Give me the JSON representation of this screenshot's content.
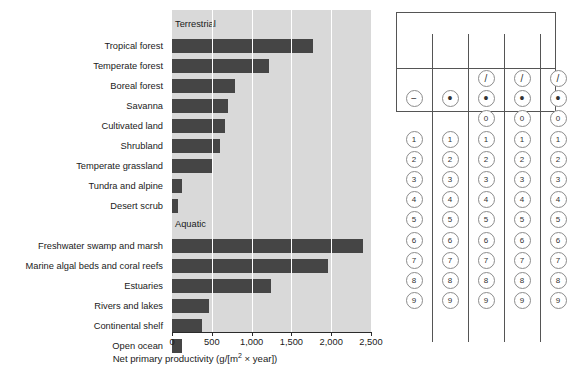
{
  "chart_data": {
    "type": "bar",
    "orientation": "horizontal",
    "title": "",
    "xlabel": "Net primary productivity (g/[m2 × year])",
    "xlabel_parts": {
      "pre": "Net primary productivity (g/[m",
      "sup": "2",
      "post": " × year])"
    },
    "ylabel": "",
    "xlim": [
      0,
      2500
    ],
    "xticks": [
      0,
      500,
      1000,
      1500,
      2000,
      2500
    ],
    "xtick_labels": [
      "0",
      "500",
      "1,000",
      "1,500",
      "2,000",
      "2,500"
    ],
    "grid": "vertical-white-gridlines",
    "legend": "none",
    "plot_bgcolor": "#d9d9d9",
    "bar_color": "#454545",
    "section_labels": [
      "Terrestrial",
      "Aquatic"
    ],
    "categories": [
      "Tropical forest",
      "Temperate forest",
      "Boreal forest",
      "Savanna",
      "Cultivated land",
      "Shrubland",
      "Temperate grassland",
      "Tundra and alpine",
      "Desert scrub",
      "Freshwater swamp and marsh",
      "Marine algal beds and coral reefs",
      "Estuaries",
      "Rivers and lakes",
      "Continental shelf",
      "Open ocean"
    ],
    "values": [
      1770,
      1220,
      790,
      700,
      670,
      600,
      520,
      130,
      70,
      2400,
      1960,
      1240,
      470,
      380,
      120
    ],
    "groups": [
      {
        "name": "Terrestrial",
        "categories": [
          "Tropical forest",
          "Temperate forest",
          "Boreal forest",
          "Savanna",
          "Cultivated land",
          "Shrubland",
          "Temperate grassland",
          "Tundra and alpine",
          "Desert scrub"
        ],
        "values": [
          1770,
          1220,
          790,
          700,
          670,
          600,
          520,
          130,
          70
        ]
      },
      {
        "name": "Aquatic",
        "categories": [
          "Freshwater swamp and marsh",
          "Marine algal beds and coral reefs",
          "Estuaries",
          "Rivers and lakes",
          "Continental shelf",
          "Open ocean"
        ],
        "values": [
          2400,
          1960,
          1240,
          470,
          380,
          120
        ]
      }
    ]
  },
  "gridin": {
    "name": "student-produced-response-grid",
    "minus_label": "−",
    "slash_label": "/",
    "dot_label": "•",
    "digits": [
      "0",
      "1",
      "2",
      "3",
      "4",
      "5",
      "6",
      "7",
      "8",
      "9"
    ],
    "columns": [
      {
        "index": 1,
        "has_minus": true,
        "has_slash": false,
        "has_dot": false,
        "has_zero": false,
        "digits": [
          "1",
          "2",
          "3",
          "4",
          "5",
          "6",
          "7",
          "8",
          "9"
        ]
      },
      {
        "index": 2,
        "has_minus": false,
        "has_slash": false,
        "has_dot": true,
        "has_zero": false,
        "digits": [
          "1",
          "2",
          "3",
          "4",
          "5",
          "6",
          "7",
          "8",
          "9"
        ]
      },
      {
        "index": 3,
        "has_minus": false,
        "has_slash": true,
        "has_dot": true,
        "has_zero": true,
        "digits": [
          "0",
          "1",
          "2",
          "3",
          "4",
          "5",
          "6",
          "7",
          "8",
          "9"
        ]
      },
      {
        "index": 4,
        "has_minus": false,
        "has_slash": true,
        "has_dot": true,
        "has_zero": true,
        "digits": [
          "0",
          "1",
          "2",
          "3",
          "4",
          "5",
          "6",
          "7",
          "8",
          "9"
        ]
      },
      {
        "index": 5,
        "has_minus": false,
        "has_slash": true,
        "has_dot": true,
        "has_zero": true,
        "digits": [
          "0",
          "1",
          "2",
          "3",
          "4",
          "5",
          "6",
          "7",
          "8",
          "9"
        ]
      }
    ],
    "answer_value": ""
  }
}
